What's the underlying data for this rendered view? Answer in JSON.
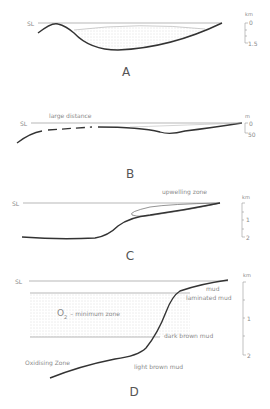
{
  "panels": [
    {
      "id": "A",
      "label": "A",
      "sea_level": "SL",
      "scale": {
        "unit": "km",
        "ticks": [
          "0",
          "1.5"
        ]
      }
    },
    {
      "id": "B",
      "label": "B",
      "sea_level": "SL",
      "annotation": "large distance",
      "scale": {
        "unit": "m",
        "ticks": [
          "0",
          "50"
        ]
      }
    },
    {
      "id": "C",
      "label": "C",
      "sea_level": "SL",
      "annotation": "upwelling zone",
      "scale": {
        "unit": "km",
        "ticks": [
          "0",
          "1",
          "2"
        ]
      }
    },
    {
      "id": "D",
      "label": "D",
      "sea_level": "SL",
      "zone_label_main": "O",
      "zone_label_sub": "2",
      "zone_label_rest": "– minimum  zone",
      "oxidising": "Oxidising  Zone",
      "sediments": [
        "mud",
        "laminated mud",
        "dark brown mud",
        "light brown mud"
      ],
      "scale": {
        "unit": "km",
        "ticks": [
          "0",
          "1",
          "2"
        ]
      }
    }
  ],
  "colors": {
    "line": "#333333",
    "thin": "#999999",
    "text": "#8a8a8a",
    "stipple": "#d8d8d8"
  }
}
